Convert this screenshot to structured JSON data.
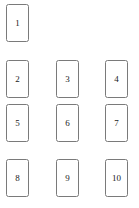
{
  "diagram": {
    "type": "numbered-box-grid",
    "background_color": "#ffffff",
    "box_fill_color": "#ffffff",
    "box_border_color": "#7a7a7a",
    "label_color": "#1a1a1a",
    "box_width": 23,
    "box_height": 38,
    "columns_x": [
      6,
      56,
      105
    ],
    "rows_y": [
      4,
      60,
      104,
      159
    ],
    "nodes": [
      {
        "label": "1",
        "col": 0,
        "row": 0,
        "x": 6,
        "y": 4
      },
      {
        "label": "2",
        "col": 0,
        "row": 1,
        "x": 6,
        "y": 60
      },
      {
        "label": "3",
        "col": 1,
        "row": 1,
        "x": 56,
        "y": 60
      },
      {
        "label": "4",
        "col": 2,
        "row": 1,
        "x": 105,
        "y": 60
      },
      {
        "label": "5",
        "col": 0,
        "row": 2,
        "x": 6,
        "y": 104
      },
      {
        "label": "6",
        "col": 1,
        "row": 2,
        "x": 56,
        "y": 104
      },
      {
        "label": "7",
        "col": 2,
        "row": 2,
        "x": 105,
        "y": 104
      },
      {
        "label": "8",
        "col": 0,
        "row": 3,
        "x": 6,
        "y": 159
      },
      {
        "label": "9",
        "col": 1,
        "row": 3,
        "x": 56,
        "y": 159
      },
      {
        "label": "10",
        "col": 2,
        "row": 3,
        "x": 105,
        "y": 159
      }
    ]
  }
}
